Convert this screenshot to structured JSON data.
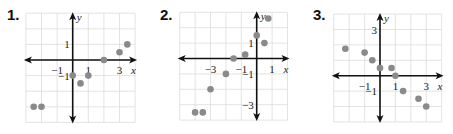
{
  "chart_data": [
    {
      "type": "scatter",
      "title": "1.",
      "xlabel": "x",
      "ylabel": "y",
      "xlim": [
        -3,
        4
      ],
      "ylim": [
        -4,
        3
      ],
      "grid": true,
      "x_tick_labels": [
        {
          "value": -1,
          "text": "−1"
        },
        {
          "value": 1,
          "text": "1"
        },
        {
          "value": 3,
          "text": "3"
        }
      ],
      "y_tick_labels": [
        {
          "value": 1,
          "text": "1"
        },
        {
          "value": -1,
          "text": "−1"
        }
      ],
      "points": [
        [
          -2.5,
          -3
        ],
        [
          -2,
          -3
        ],
        [
          0,
          -1
        ],
        [
          0.5,
          -1.5
        ],
        [
          1,
          -1
        ],
        [
          2,
          0
        ],
        [
          3,
          0.5
        ],
        [
          3.5,
          1
        ]
      ]
    },
    {
      "type": "scatter",
      "title": "2.",
      "xlabel": "x",
      "ylabel": "y",
      "xlim": [
        -5,
        2
      ],
      "ylim": [
        -4,
        3
      ],
      "grid": true,
      "x_tick_labels": [
        {
          "value": -3,
          "text": "−3"
        },
        {
          "value": -1,
          "text": "−1"
        },
        {
          "value": 1,
          "text": "1"
        }
      ],
      "y_tick_labels": [
        {
          "value": 1,
          "text": "1"
        },
        {
          "value": -1,
          "text": "−1"
        },
        {
          "value": -3,
          "text": "−3"
        }
      ],
      "points": [
        [
          -4,
          -3.5
        ],
        [
          -3.5,
          -3.5
        ],
        [
          -3,
          -2
        ],
        [
          -2,
          -1
        ],
        [
          -1.5,
          0
        ],
        [
          -0.75,
          0.25
        ],
        [
          0,
          1.5
        ],
        [
          0.5,
          1
        ],
        [
          0.75,
          2.6
        ]
      ]
    },
    {
      "type": "scatter",
      "title": "3.",
      "xlabel": "x",
      "ylabel": "y",
      "xlim": [
        -3,
        4
      ],
      "ylim": [
        -3,
        4
      ],
      "grid": true,
      "x_tick_labels": [
        {
          "value": -1,
          "text": "−1"
        },
        {
          "value": 1,
          "text": "1"
        },
        {
          "value": 3,
          "text": "3"
        }
      ],
      "y_tick_labels": [
        {
          "value": 3,
          "text": "3"
        },
        {
          "value": -1,
          "text": "−1"
        }
      ],
      "points": [
        [
          -2.25,
          1.75
        ],
        [
          -1,
          1.5
        ],
        [
          -0.5,
          1
        ],
        [
          0,
          0.5
        ],
        [
          0.75,
          0.5
        ],
        [
          1,
          0
        ],
        [
          1.5,
          -1
        ],
        [
          2.5,
          -1.5
        ],
        [
          3,
          -2
        ]
      ]
    }
  ],
  "panels": [
    {
      "number": "1.",
      "axis_x": "x",
      "axis_y": "y"
    },
    {
      "number": "2.",
      "axis_x": "x",
      "axis_y": "y"
    },
    {
      "number": "3.",
      "axis_x": "x",
      "axis_y": "y"
    }
  ],
  "colors": {
    "grid": "#dcdcdc",
    "axis": "#111111",
    "point": "#8a8a8a",
    "text": "#222222"
  }
}
